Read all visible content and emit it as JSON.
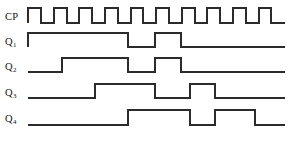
{
  "diagram": {
    "type": "timing-diagram",
    "stroke_color": "#2b2b2b",
    "background_color": "#ffffff",
    "width": 292,
    "height": 147
  },
  "labels": {
    "cp": "CP",
    "q1_base": "Q",
    "q1_sub": "1",
    "q2_base": "Q",
    "q2_sub": "2",
    "q3_base": "Q",
    "q3_sub": "3",
    "q4_base": "Q",
    "q4_sub": "4"
  },
  "chart_data": {
    "type": "line",
    "xlabel": "",
    "ylabel": "",
    "grid": false,
    "legend": "none",
    "time_axis": {
      "x_start": 28,
      "x_end": 285,
      "clock_period": 25.7,
      "clock_high_width": 12.8,
      "clock_cycles": 10
    },
    "signals": [
      {
        "name": "CP",
        "row_y_high": 8,
        "row_y_low": 23,
        "description": "Clock pulse train, 10 cycles",
        "transitions": [
          {
            "x": 28,
            "level": 1
          },
          {
            "x": 41,
            "level": 0
          },
          {
            "x": 54,
            "level": 1
          },
          {
            "x": 67,
            "level": 0
          },
          {
            "x": 79,
            "level": 1
          },
          {
            "x": 92,
            "level": 0
          },
          {
            "x": 105,
            "level": 1
          },
          {
            "x": 118,
            "level": 0
          },
          {
            "x": 131,
            "level": 1
          },
          {
            "x": 143,
            "level": 0
          },
          {
            "x": 156,
            "level": 1
          },
          {
            "x": 169,
            "level": 0
          },
          {
            "x": 182,
            "level": 1
          },
          {
            "x": 195,
            "level": 0
          },
          {
            "x": 207,
            "level": 1
          },
          {
            "x": 220,
            "level": 0
          },
          {
            "x": 233,
            "level": 1
          },
          {
            "x": 246,
            "level": 0
          },
          {
            "x": 259,
            "level": 1
          },
          {
            "x": 271,
            "level": 0
          }
        ]
      },
      {
        "name": "Q1",
        "row_y_high": 33,
        "row_y_low": 47,
        "description": "Output 1",
        "transitions": [
          {
            "x": 28,
            "level": 1
          },
          {
            "x": 128,
            "level": 0
          },
          {
            "x": 155,
            "level": 1
          },
          {
            "x": 181,
            "level": 0
          }
        ]
      },
      {
        "name": "Q2",
        "row_y_high": 58,
        "row_y_low": 72,
        "description": "Output 2",
        "transitions": [
          {
            "x": 62,
            "level": 1
          },
          {
            "x": 128,
            "level": 0
          },
          {
            "x": 155,
            "level": 1
          },
          {
            "x": 181,
            "level": 0
          }
        ]
      },
      {
        "name": "Q3",
        "row_y_high": 84,
        "row_y_low": 98,
        "description": "Output 3",
        "transitions": [
          {
            "x": 95,
            "level": 1
          },
          {
            "x": 155,
            "level": 0
          },
          {
            "x": 190,
            "level": 1
          },
          {
            "x": 215,
            "level": 0
          }
        ]
      },
      {
        "name": "Q4",
        "row_y_high": 110,
        "row_y_low": 125,
        "description": "Output 4",
        "transitions": [
          {
            "x": 128,
            "level": 1
          },
          {
            "x": 190,
            "level": 0
          },
          {
            "x": 215,
            "level": 1
          },
          {
            "x": 255,
            "level": 0
          }
        ]
      }
    ]
  }
}
